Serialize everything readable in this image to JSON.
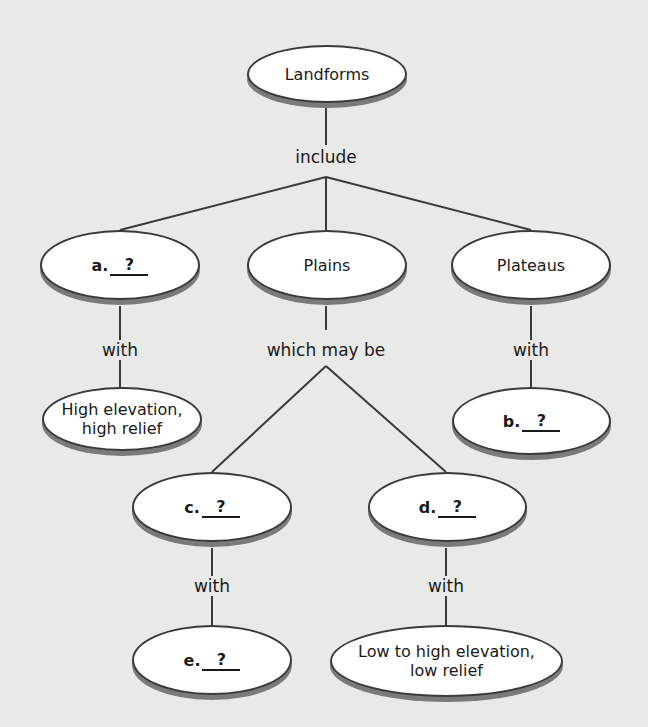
{
  "diagram": {
    "root": "Landforms",
    "connector_root": "include",
    "level1": [
      {
        "prefix": "a.",
        "answer": "?",
        "connector": "with",
        "child": "High elevation, high relief"
      },
      {
        "label": "Plains",
        "connector": "which may be"
      },
      {
        "label": "Plateaus",
        "connector": "with",
        "child_prefix": "b.",
        "child_answer": "?"
      }
    ],
    "plains_children": [
      {
        "prefix": "c.",
        "answer": "?",
        "connector": "with",
        "child_prefix": "e.",
        "child_answer": "?"
      },
      {
        "prefix": "d.",
        "answer": "?",
        "connector": "with",
        "child": "Low to high elevation, low relief"
      }
    ],
    "child_lines": {
      "high_line1": "High elevation,",
      "high_line2": "high relief",
      "low_line1": "Low to high elevation,",
      "low_line2": "low relief"
    }
  }
}
